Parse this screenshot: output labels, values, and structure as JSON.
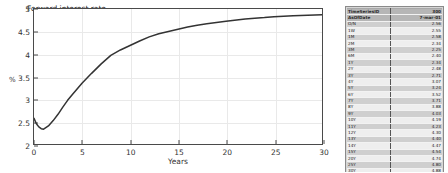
{
  "chart_data": {
    "type": "line",
    "title": "",
    "xlabel": "Years",
    "ylabel": "%",
    "xlim": [
      0,
      30
    ],
    "ylim": [
      2,
      5
    ],
    "grid": true,
    "legend_position": "top-left",
    "xticks": [
      "0",
      "5",
      "10",
      "15",
      "20",
      "25",
      "30"
    ],
    "yticks": [
      "2",
      "2.5",
      "3",
      "3.5",
      "4",
      "4.5",
      "5"
    ],
    "series": [
      {
        "name": "Forward interest rate",
        "color": "#333333",
        "x": [
          0,
          0.25,
          0.5,
          0.75,
          1,
          1.5,
          2,
          2.5,
          3,
          3.5,
          4,
          5,
          6,
          7,
          8,
          9,
          10,
          11,
          12,
          13,
          14,
          15,
          16,
          17,
          18,
          20,
          22,
          24,
          25,
          27,
          30
        ],
        "y": [
          2.57,
          2.45,
          2.38,
          2.34,
          2.33,
          2.4,
          2.52,
          2.66,
          2.82,
          2.97,
          3.1,
          3.35,
          3.57,
          3.78,
          3.97,
          4.09,
          4.19,
          4.29,
          4.38,
          4.45,
          4.5,
          4.55,
          4.6,
          4.64,
          4.67,
          4.73,
          4.78,
          4.81,
          4.83,
          4.85,
          4.87
        ]
      }
    ]
  },
  "chart": {
    "legend_label": "Forward interest rate",
    "xlabel": "Years",
    "ylabel": "%"
  },
  "table": {
    "header_rows": [
      {
        "label": "TimeSeriesID",
        "value": "300"
      },
      {
        "label": "AsOfDate",
        "value": "7-mar-01"
      }
    ],
    "rows": [
      {
        "label": "O/N",
        "value": "2.56"
      },
      {
        "label": "1W",
        "value": "2.55"
      },
      {
        "label": "1M",
        "value": "2.58"
      },
      {
        "label": "2M",
        "value": "2.34"
      },
      {
        "label": "3M",
        "value": "2.25"
      },
      {
        "label": "6M",
        "value": "2.40"
      },
      {
        "label": "1Y",
        "value": "2.34"
      },
      {
        "label": "2Y",
        "value": "2.48"
      },
      {
        "label": "3Y",
        "value": "2.71"
      },
      {
        "label": "4Y",
        "value": "3.07"
      },
      {
        "label": "5Y",
        "value": "3.24"
      },
      {
        "label": "6Y",
        "value": "3.52"
      },
      {
        "label": "7Y",
        "value": "3.71"
      },
      {
        "label": "8Y",
        "value": "3.88"
      },
      {
        "label": "9Y",
        "value": "4.03"
      },
      {
        "label": "10Y",
        "value": "4.19"
      },
      {
        "label": "11Y",
        "value": "4.23"
      },
      {
        "label": "12Y",
        "value": "4.30"
      },
      {
        "label": "13Y",
        "value": "4.40"
      },
      {
        "label": "14Y",
        "value": "4.47"
      },
      {
        "label": "15Y",
        "value": "4.54"
      },
      {
        "label": "20Y",
        "value": "4.74"
      },
      {
        "label": "25Y",
        "value": "4.80"
      },
      {
        "label": "30Y",
        "value": "4.88"
      }
    ]
  }
}
